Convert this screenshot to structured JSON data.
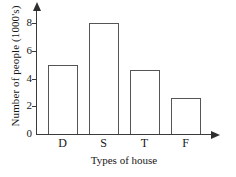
{
  "chart_data": {
    "type": "bar",
    "title": "",
    "xlabel": "Types of house",
    "ylabel": "Number of people (1000's)",
    "categories": [
      "D",
      "S",
      "T",
      "F"
    ],
    "values": [
      5,
      8,
      4.65,
      2.6
    ],
    "ylim": [
      0,
      8.8
    ],
    "yticks": [
      0,
      2,
      4,
      6,
      8
    ],
    "ytick_labels": [
      "0",
      "2",
      "4",
      "6",
      "8"
    ],
    "xtick_labels": [
      "D",
      "S",
      "T",
      "F"
    ],
    "grid": false,
    "legend": false,
    "series": [
      {
        "name": "Number of people (1000's)",
        "values": [
          5,
          8,
          4.65,
          2.6
        ]
      }
    ],
    "style": {
      "bar_fill": "#ffffff",
      "bar_outline": "#555555",
      "axis_color": "#3a3a3a",
      "text_color": "#171717",
      "background": "#ffffff",
      "y_axis_arrow": true,
      "x_axis_arrow": true
    }
  }
}
